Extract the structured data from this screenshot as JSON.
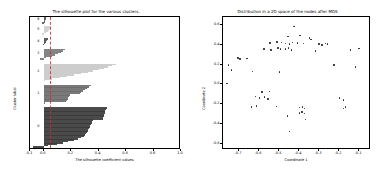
{
  "figure": {
    "width": 383,
    "height": 173,
    "background": "#ffffff"
  },
  "left_panel": {
    "title": "The silhouette plot for the various clusters.",
    "xlabel": "The silhouette coefficient values",
    "ylabel": "Cluster label"
  },
  "right_panel": {
    "title": "Distribution in a 2D space of the nodes after MDS",
    "xlabel": "Coordinate 1",
    "ylabel": "Coordinate 2"
  },
  "chart_data": [
    {
      "type": "bar",
      "id": "silhouette-plot",
      "title": "The silhouette plot for the various clusters.",
      "xlabel": "The silhouette coefficient values",
      "ylabel": "Cluster label",
      "xlim": [
        -0.1,
        1.0
      ],
      "ylim": [
        0,
        100
      ],
      "xticks": [
        -0.1,
        0.0,
        0.2,
        0.4,
        0.6,
        0.8,
        1.0
      ],
      "xticklabels": [
        "-0.1",
        "0.0",
        "0.2",
        "0.4",
        "0.6",
        "0.8",
        "1.0"
      ],
      "grid": false,
      "legend": null,
      "average_silhouette_score": 0.045,
      "avg_line_color": "#d62728",
      "avg_line_style": "dashed",
      "orientation": "horizontal",
      "cluster_labels": [
        "0",
        "1",
        "2",
        "3",
        "4",
        "5",
        "6"
      ],
      "clusters": [
        {
          "label": "0",
          "color": "#3b3b3b",
          "size": 30,
          "y_bottom": 2,
          "y_top": 32,
          "silhouette_max": 0.46,
          "silhouette_min": -0.075,
          "profile": [
            0.46,
            0.455,
            0.45,
            0.447,
            0.444,
            0.44,
            0.436,
            0.432,
            0.43,
            0.36,
            0.355,
            0.35,
            0.345,
            0.34,
            0.335,
            0.33,
            0.325,
            0.32,
            0.315,
            0.31,
            0.3,
            0.29,
            0.27,
            0.25,
            0.22,
            0.18,
            0.14,
            0.1,
            0.03,
            -0.075
          ]
        },
        {
          "label": "1",
          "color": "#6e6e6e",
          "size": 14,
          "y_bottom": 35,
          "y_top": 49,
          "silhouette_max": 0.345,
          "silhouette_min": 0.005,
          "profile": [
            0.345,
            0.33,
            0.315,
            0.3,
            0.285,
            0.275,
            0.265,
            0.19,
            0.185,
            0.18,
            0.175,
            0.17,
            0.16,
            0.005
          ]
        },
        {
          "label": "2",
          "color": "#c9c9c9",
          "size": 13,
          "y_bottom": 52,
          "y_top": 65,
          "silhouette_max": 0.53,
          "silhouette_min": 0.0,
          "profile": [
            0.53,
            0.5,
            0.47,
            0.44,
            0.4,
            0.36,
            0.32,
            0.27,
            0.22,
            0.17,
            0.12,
            0.06,
            0.0
          ]
        },
        {
          "label": "3",
          "color": "#7a7a7a",
          "size": 8,
          "y_bottom": 68,
          "y_top": 76,
          "silhouette_max": 0.155,
          "silhouette_min": -0.03,
          "profile": [
            0.155,
            0.14,
            0.125,
            0.105,
            0.085,
            0.06,
            0.02,
            -0.03
          ]
        },
        {
          "label": "4",
          "color": "#4f4f4f",
          "size": 5,
          "y_bottom": 79,
          "y_top": 84,
          "silhouette_max": 0.03,
          "silhouette_min": -0.005,
          "profile": [
            0.03,
            0.025,
            0.02,
            0.01,
            -0.005
          ]
        },
        {
          "label": "5",
          "color": "#cfcfcf",
          "size": 6,
          "y_bottom": 87,
          "y_top": 93,
          "silhouette_max": 0.055,
          "silhouette_min": -0.015,
          "profile": [
            0.055,
            0.048,
            0.04,
            0.03,
            0.015,
            -0.015
          ]
        },
        {
          "label": "6",
          "color": "#5a5a5a",
          "size": 5,
          "y_bottom": 95,
          "y_top": 100,
          "silhouette_max": 0.02,
          "silhouette_min": -0.01,
          "profile": [
            0.02,
            0.015,
            0.01,
            0.0,
            -0.01
          ]
        }
      ]
    },
    {
      "type": "scatter",
      "id": "mds-scatter",
      "title": "Distribution in a 2D space of the nodes after MDS",
      "xlabel": "Coordinate 1",
      "ylabel": "Coordinate 2",
      "xlim": [
        -0.78,
        -0.04
      ],
      "ylim": [
        -0.66,
        0.68
      ],
      "xticks": [
        -0.7,
        -0.6,
        -0.5,
        -0.4,
        -0.3,
        -0.2,
        -0.1
      ],
      "xticklabels": [
        "-0.7",
        "-0.6",
        "-0.5",
        "-0.4",
        "-0.3",
        "-0.2",
        "-0.1"
      ],
      "yticks": [
        0.6,
        0.4,
        0.2,
        0.0,
        -0.2,
        -0.4,
        -0.6
      ],
      "yticklabels": [
        "0.6",
        "0.4",
        "0.2",
        "0.0",
        "-0.2",
        "-0.4",
        "-0.6"
      ],
      "grid": false,
      "legend": null,
      "marker_color": "#1f1f1f",
      "marker_size": 1.6,
      "points": [
        [
          -0.425,
          0.585
        ],
        [
          -0.455,
          0.485
        ],
        [
          -0.395,
          0.495
        ],
        [
          -0.348,
          0.47
        ],
        [
          -0.34,
          0.455
        ],
        [
          -0.545,
          0.42
        ],
        [
          -0.51,
          0.43
        ],
        [
          -0.488,
          0.425
        ],
        [
          -0.468,
          0.415
        ],
        [
          -0.448,
          0.408
        ],
        [
          -0.432,
          0.425
        ],
        [
          -0.408,
          0.42
        ],
        [
          -0.378,
          0.415
        ],
        [
          -0.3,
          0.405
        ],
        [
          -0.285,
          0.398
        ],
        [
          -0.268,
          0.412
        ],
        [
          -0.258,
          0.405
        ],
        [
          -0.575,
          0.355
        ],
        [
          -0.54,
          0.345
        ],
        [
          -0.505,
          0.37
        ],
        [
          -0.492,
          0.36
        ],
        [
          -0.468,
          0.355
        ],
        [
          -0.452,
          0.368
        ],
        [
          -0.438,
          0.35
        ],
        [
          -0.318,
          0.34
        ],
        [
          -0.142,
          0.345
        ],
        [
          -0.1,
          0.362
        ],
        [
          -0.705,
          0.268
        ],
        [
          -0.695,
          0.255
        ],
        [
          -0.66,
          0.262
        ],
        [
          -0.752,
          0.198
        ],
        [
          -0.225,
          0.195
        ],
        [
          -0.118,
          0.175
        ],
        [
          -0.738,
          0.148
        ],
        [
          -0.632,
          0.13
        ],
        [
          -0.498,
          0.128
        ],
        [
          -0.76,
          0.012
        ],
        [
          -0.585,
          -0.075
        ],
        [
          -0.548,
          -0.072
        ],
        [
          -0.618,
          -0.12
        ],
        [
          -0.598,
          -0.135
        ],
        [
          -0.572,
          -0.128
        ],
        [
          -0.555,
          -0.148
        ],
        [
          -0.198,
          -0.138
        ],
        [
          -0.178,
          -0.158
        ],
        [
          -0.638,
          -0.228
        ],
        [
          -0.612,
          -0.215
        ],
        [
          -0.512,
          -0.222
        ],
        [
          -0.398,
          -0.232
        ],
        [
          -0.382,
          -0.225
        ],
        [
          -0.372,
          -0.24
        ],
        [
          -0.178,
          -0.242
        ],
        [
          -0.168,
          -0.225
        ],
        [
          -0.398,
          -0.285
        ],
        [
          -0.385,
          -0.278
        ],
        [
          -0.372,
          -0.292
        ],
        [
          -0.458,
          -0.318
        ],
        [
          -0.368,
          -0.352
        ],
        [
          -0.448,
          -0.472
        ]
      ]
    }
  ]
}
